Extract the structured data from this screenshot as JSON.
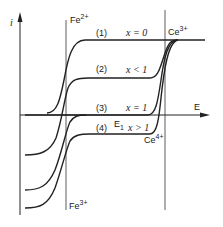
{
  "diagram": {
    "y_axis_label": "i",
    "x_axis_label": "E",
    "vertical_lines": [
      {
        "label": "Fe",
        "sup": "2+",
        "bottom_label": "Fe",
        "bottom_sup": "3+"
      },
      {
        "label": "Ce",
        "sup": "3+",
        "bottom_label": "Ce",
        "bottom_sup": "4+"
      }
    ],
    "curves": [
      {
        "id": "(1)",
        "condition": "x = 0"
      },
      {
        "id": "(2)",
        "condition": "x < 1"
      },
      {
        "id": "(3)",
        "condition": "x = 1"
      },
      {
        "id": "(4)",
        "condition": "x > 1"
      }
    ],
    "e1_label": "E",
    "e1_sub": "1"
  }
}
